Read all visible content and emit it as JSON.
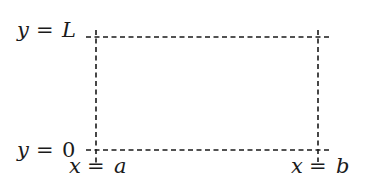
{
  "diagram": {
    "title": "",
    "labels": {
      "top_line": {
        "lhs": "y",
        "eq": "=",
        "rhs": "L"
      },
      "bottom_line": {
        "lhs": "y",
        "eq": "=",
        "rhs": "0"
      },
      "left_line": {
        "lhs": "x",
        "eq": "=",
        "rhs": "a"
      },
      "right_line": {
        "lhs": "x",
        "eq": "=",
        "rhs": "b"
      }
    },
    "lines": [
      {
        "name": "y = L",
        "orientation": "horizontal",
        "style": "dashed"
      },
      {
        "name": "y = 0",
        "orientation": "horizontal",
        "style": "dashed"
      },
      {
        "name": "x = a",
        "orientation": "vertical",
        "style": "dashed"
      },
      {
        "name": "x = b",
        "orientation": "vertical",
        "style": "dashed"
      }
    ],
    "line_color": "#1a1a1a"
  }
}
